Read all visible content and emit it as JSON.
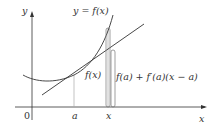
{
  "diagram": {
    "axes": {
      "x_label": "x",
      "y_label": "y",
      "origin_label": "0"
    },
    "curve_label": "y = f(x)",
    "ticks": {
      "a": "a",
      "x": "x"
    },
    "brace_labels": {
      "fx": "f(x)",
      "tangent": "f(a) + f′(a)(x − a)"
    },
    "colors": {
      "axis": "#333333",
      "curve": "#333333",
      "tangent": "#333333",
      "guide": "#aaaaaa"
    }
  }
}
